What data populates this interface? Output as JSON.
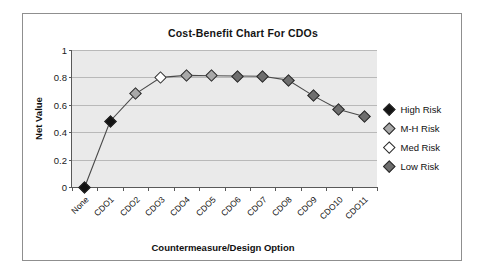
{
  "chart_data": {
    "type": "line",
    "title": "Cost-Benefit Chart For CDOs",
    "xlabel": "Countermeasure/Design Option",
    "ylabel": "Net Value",
    "ylim": [
      0,
      1
    ],
    "yticks": [
      "0",
      "0.2",
      "0.4",
      "0.6",
      "0.8",
      "1"
    ],
    "ytick_values": [
      0,
      0.2,
      0.4,
      0.6,
      0.8,
      1
    ],
    "grid": true,
    "legend_position": "right",
    "categories": [
      "None",
      "CDO1",
      "CDO2",
      "CDO3",
      "CDO4",
      "CDO5",
      "CDO6",
      "CDO7",
      "CDO8",
      "CDO9",
      "CDO10",
      "CDO11"
    ],
    "values": [
      0.0,
      0.48,
      0.68,
      0.8,
      0.815,
      0.812,
      0.81,
      0.808,
      0.78,
      0.665,
      0.565,
      0.515
    ],
    "point_risk": [
      "High Risk",
      "High Risk",
      "M-H Risk",
      "Med Risk",
      "M-H Risk",
      "M-H Risk",
      "Low Risk",
      "Low Risk",
      "Low Risk",
      "Low Risk",
      "Low Risk",
      "Low Risk"
    ],
    "series": [
      {
        "name": "Net Value",
        "values": [
          0.0,
          0.48,
          0.68,
          0.8,
          0.815,
          0.812,
          0.81,
          0.808,
          0.78,
          0.665,
          0.565,
          0.515
        ]
      }
    ],
    "legend": [
      {
        "label": "High Risk",
        "color": "#141414"
      },
      {
        "label": "M-H Risk",
        "color": "#a8a8a8"
      },
      {
        "label": "Med Risk",
        "color": "#ffffff"
      },
      {
        "label": "Low Risk",
        "color": "#6e6e6e"
      }
    ],
    "colors": {
      "High Risk": "#141414",
      "M-H Risk": "#a8a8a8",
      "Med Risk": "#ffffff",
      "Low Risk": "#6e6e6e",
      "plot_background": "#eaeaea",
      "gridline": "#b9b9b9",
      "axis": "#595959",
      "line": "#4a4a4a"
    }
  }
}
